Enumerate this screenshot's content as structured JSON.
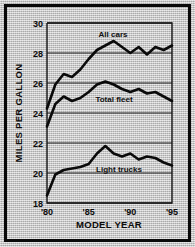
{
  "figure": {
    "background_color": "#c9c9c9",
    "ink_color": "#0a0a0a"
  },
  "chart_data": {
    "type": "line",
    "title": "",
    "xlabel": "MODEL YEAR",
    "ylabel": "MILES PER GALLON",
    "grid": true,
    "legend_position": "inline-labels",
    "xlim": [
      1980,
      1995
    ],
    "ylim": [
      18,
      30
    ],
    "ytick_labels": [
      "18",
      "20",
      "22",
      "24",
      "26",
      "28",
      "30"
    ],
    "ytick_values": [
      18,
      20,
      22,
      24,
      26,
      28,
      30
    ],
    "xtick_labels": [
      "'80",
      "'85",
      "'90",
      "'95"
    ],
    "xtick_values": [
      1980,
      1985,
      1990,
      1995
    ],
    "x": [
      1980,
      1981,
      1982,
      1983,
      1984,
      1985,
      1986,
      1987,
      1988,
      1989,
      1990,
      1991,
      1992,
      1993,
      1994,
      1995
    ],
    "series": [
      {
        "name": "All cars",
        "values": [
          24.3,
          25.9,
          26.6,
          26.4,
          26.9,
          27.6,
          28.2,
          28.5,
          28.8,
          28.4,
          28.0,
          28.4,
          27.9,
          28.4,
          28.2,
          28.5
        ]
      },
      {
        "name": "Total fleet",
        "values": [
          23.1,
          24.6,
          25.1,
          24.8,
          25.0,
          25.4,
          25.9,
          26.1,
          25.9,
          25.6,
          25.4,
          25.6,
          25.3,
          25.4,
          25.1,
          24.8
        ]
      },
      {
        "name": "Light trucks",
        "values": [
          18.5,
          19.9,
          20.2,
          20.3,
          20.4,
          20.6,
          21.3,
          21.8,
          21.3,
          21.1,
          21.3,
          20.9,
          21.1,
          21.0,
          20.7,
          20.5
        ]
      }
    ]
  }
}
